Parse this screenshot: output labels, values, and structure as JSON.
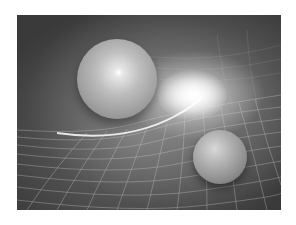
{
  "image": {
    "subject": "Spacetime curvature illustration",
    "description": "Grayscale render of two spheres resting on a warped wireframe grid, with a bright light glow between them",
    "colors": {
      "page_background": "#ffffff",
      "background_dark": "#3a3a3a",
      "background_mid": "#6a6a6a",
      "grid_line": "#d0d0d0",
      "highlight": "#ffffff"
    },
    "objects": [
      {
        "name": "large-sphere",
        "center": [
          117,
          79
        ],
        "diameter": 80
      },
      {
        "name": "small-sphere",
        "center": [
          220,
          157
        ],
        "diameter": 54
      },
      {
        "name": "light-glow",
        "center": [
          175,
          80
        ]
      }
    ]
  }
}
